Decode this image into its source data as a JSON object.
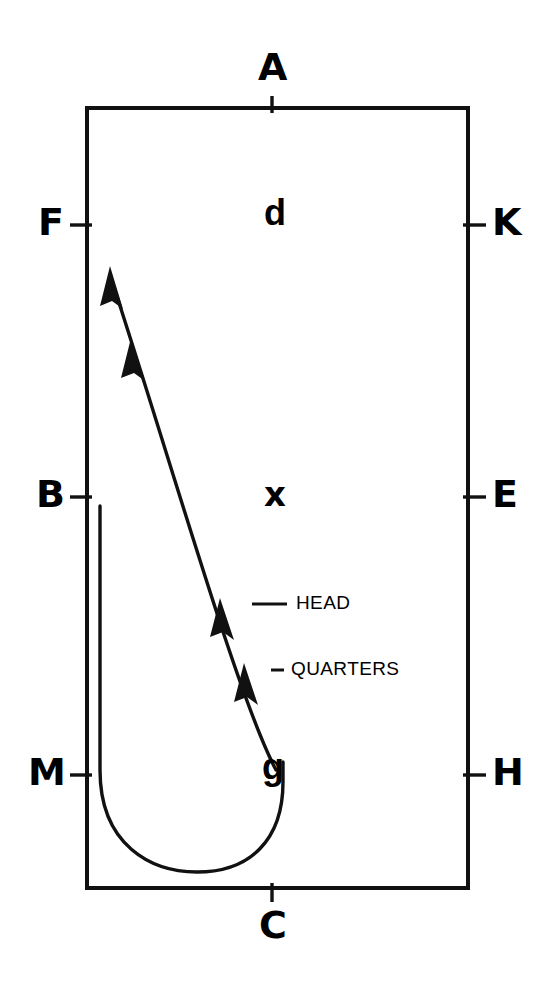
{
  "diagram": {
    "background_color": "#ffffff",
    "stroke_color": "#000000",
    "frame": {
      "left": 87,
      "top": 108,
      "right": 468,
      "bottom": 888,
      "stroke_width": 4
    },
    "edge_labels": [
      {
        "id": "A",
        "text": "A",
        "side": "top",
        "x": 272,
        "y": 52,
        "tick": {
          "x1": 272,
          "y1": 96,
          "x2": 272,
          "y2": 112
        }
      },
      {
        "id": "C",
        "text": "C",
        "side": "bottom",
        "x": 272,
        "y": 906,
        "tick": {
          "x1": 272,
          "y1": 884,
          "x2": 272,
          "y2": 902
        }
      },
      {
        "id": "F",
        "text": "F",
        "side": "left",
        "x": 40,
        "y": 203,
        "tick": {
          "x1": 70,
          "y1": 225,
          "x2": 91,
          "y2": 225
        }
      },
      {
        "id": "B",
        "text": "B",
        "side": "left",
        "x": 38,
        "y": 475,
        "tick": {
          "x1": 70,
          "y1": 497,
          "x2": 91,
          "y2": 497
        }
      },
      {
        "id": "M",
        "text": "M",
        "side": "left",
        "x": 32,
        "y": 753,
        "tick": {
          "x1": 70,
          "y1": 775,
          "x2": 91,
          "y2": 775
        }
      },
      {
        "id": "K",
        "text": "K",
        "side": "right",
        "x": 491,
        "y": 203,
        "tick": {
          "x1": 464,
          "y1": 225,
          "x2": 486,
          "y2": 225
        }
      },
      {
        "id": "E",
        "text": "E",
        "side": "right",
        "x": 491,
        "y": 475,
        "tick": {
          "x1": 464,
          "y1": 497,
          "x2": 486,
          "y2": 497
        }
      },
      {
        "id": "H",
        "text": "H",
        "side": "right",
        "x": 491,
        "y": 753,
        "tick": {
          "x1": 464,
          "y1": 775,
          "x2": 486,
          "y2": 775
        }
      }
    ],
    "interior_labels": [
      {
        "id": "d",
        "text": "d",
        "x": 265,
        "y": 196,
        "style": "thin"
      },
      {
        "id": "x",
        "text": "x",
        "x": 266,
        "y": 477,
        "style": "bold"
      },
      {
        "id": "g",
        "text": "g",
        "x": 264,
        "y": 750,
        "style": "thin"
      }
    ],
    "callouts": [
      {
        "id": "head",
        "text": "HEAD",
        "text_x": 296,
        "text_y": 593,
        "leader": {
          "x1": 255,
          "y1": 604,
          "x2": 288,
          "y2": 604
        },
        "arrow_at": {
          "x": 224,
          "y": 616
        }
      },
      {
        "id": "quarters",
        "text": "QUARTERS",
        "text_x": 291,
        "text_y": 659,
        "leader": {
          "x1": 272,
          "y1": 670,
          "x2": 285,
          "y2": 670
        },
        "arrow_at": {
          "x": 247,
          "y": 678
        }
      }
    ],
    "trajectory": {
      "name": "diagonal-arrow-line",
      "description": "Slightly bowed line from point g rising to upper-left, carrying four arrowheads pointing up-left",
      "path": "M 275 772 C 236 700, 175 480, 111 279",
      "stroke_width": 3.4,
      "arrowheads": [
        {
          "id": "tip",
          "x": 111,
          "y": 279,
          "angle": -107
        },
        {
          "id": "second",
          "x": 132,
          "y": 350,
          "angle": -106
        },
        {
          "id": "head",
          "x": 222,
          "y": 611,
          "angle": -103
        },
        {
          "id": "quarters",
          "x": 245,
          "y": 676,
          "angle": -101
        }
      ]
    },
    "u_curve": {
      "name": "u-shaped-loop",
      "description": "Narrow U loop: vertical stem down from B level, round bottom, up to point g",
      "path": "M 100 506 L 100 770 C 100 846, 152 872, 197 872 C 250 872, 283 840, 283 782 L 283 760",
      "stroke_width": 3.4
    }
  }
}
